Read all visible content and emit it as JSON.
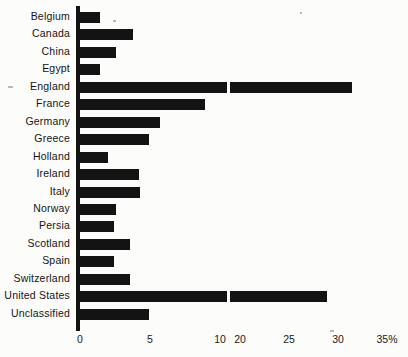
{
  "chart_data": {
    "type": "bar",
    "orientation": "horizontal",
    "title": "",
    "xlabel": "",
    "ylabel": "",
    "grid": false,
    "legend": null,
    "axis_unit": "%",
    "axis_break": {
      "present": true,
      "between": [
        10,
        20
      ],
      "note": "x-axis compressed/broken between the 10 and 20 tick marks"
    },
    "xlim": [
      0,
      35
    ],
    "tick_labels": [
      "0",
      "5",
      "10",
      "20",
      "25",
      "30",
      "35%"
    ],
    "tick_values": [
      0,
      5,
      10,
      20,
      25,
      30,
      35
    ],
    "categories": [
      "Belgium",
      "Canada",
      "China",
      "Egypt",
      "England",
      "France",
      "Germany",
      "Greece",
      "Holland",
      "Ireland",
      "Italy",
      "Norway",
      "Persia",
      "Scotland",
      "Spain",
      "Switzerland",
      "United States",
      "Unclassified"
    ],
    "values": [
      1.4,
      3.8,
      2.6,
      1.4,
      31.4,
      8.9,
      5.7,
      4.9,
      2.0,
      4.2,
      4.3,
      2.6,
      2.4,
      3.6,
      2.4,
      3.6,
      28.9,
      4.9
    ]
  },
  "axis": {
    "ticks": [
      {
        "label": "0",
        "value": 0
      },
      {
        "label": "5",
        "value": 5
      },
      {
        "label": "10",
        "value": 10
      },
      {
        "label": "20",
        "value": 20
      },
      {
        "label": "25",
        "value": 25
      },
      {
        "label": "30",
        "value": 30
      },
      {
        "label": "35%",
        "value": 35
      }
    ]
  },
  "caption": {
    "clipped_text": "stripe of clipped text"
  }
}
